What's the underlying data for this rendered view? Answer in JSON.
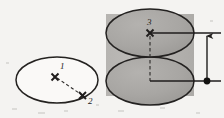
{
  "figure": {
    "background_color": "#f4f3f1",
    "ink_color": "#1f1d1c",
    "fill_gray_dark": "#a6a4a2",
    "fill_gray_light": "#b8b6b3",
    "fill_white": "#faf9f7"
  },
  "ellipse_figure": {
    "name": "base-ellipse",
    "center_point": {
      "id": "1",
      "label": "1",
      "marker": "x-marker",
      "x": 55,
      "y": 76
    },
    "edge_point": {
      "id": "2",
      "label": "2",
      "marker": "x-marker",
      "x": 84,
      "y": 97
    },
    "radius_line_style": "dashed",
    "fill": "none",
    "cx": 57,
    "cy": 80,
    "rx": 41,
    "ry": 23
  },
  "cylinder_figure": {
    "name": "cylinder",
    "top_point": {
      "id": "3",
      "label": "3",
      "marker": "x-marker",
      "x": 150,
      "y": 33
    },
    "bottom_center": {
      "x": 150,
      "y": 81
    },
    "axis_line_style": "dashed",
    "top_ellipse": {
      "cx": 150,
      "cy": 33,
      "rx": 44,
      "ry": 24
    },
    "bottom_ellipse": {
      "cx": 150,
      "cy": 81,
      "rx": 44,
      "ry": 24
    },
    "body": {
      "x": 106,
      "y": 14,
      "width": 88,
      "height": 82
    }
  },
  "dimension": {
    "name": "height-dimension",
    "orientation": "vertical",
    "top_marker": "arrow-up",
    "bottom_marker": "filled-dot",
    "line_x": 207,
    "top_y": 33,
    "bottom_y": 81,
    "upper_leader": {
      "x1": 150,
      "x2": 220,
      "y": 33
    },
    "lower_leader": {
      "x1": 150,
      "x2": 220,
      "y": 81
    }
  }
}
